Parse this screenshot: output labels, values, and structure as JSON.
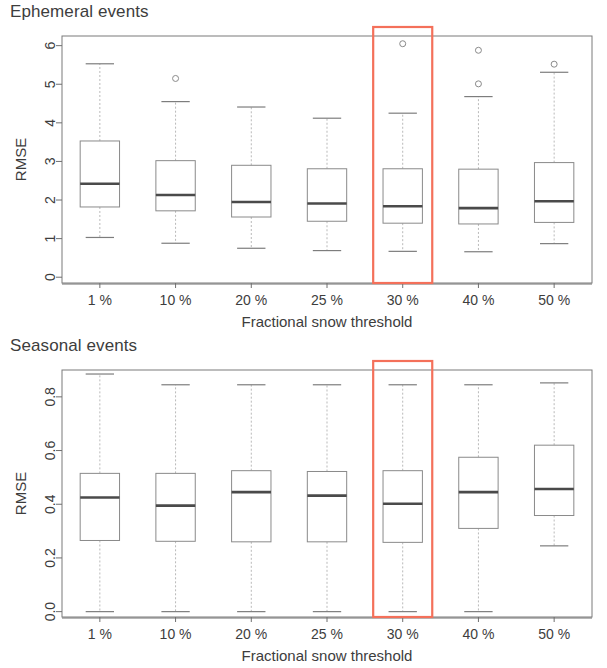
{
  "figure": {
    "width": 607,
    "height": 668,
    "background": "#ffffff",
    "highlight_color": "#f4705a",
    "box_line_color": "#8a8a8a",
    "median_color": "#4a4a4a",
    "whisker_color": "#b9b9b9"
  },
  "chart_data": [
    {
      "type": "box",
      "panel_id": "ephemeral",
      "title": "Ephemeral events",
      "xlabel": "Fractional snow threshold",
      "ylabel": "RMSE",
      "categories": [
        "1 %",
        "10 %",
        "20 %",
        "25 %",
        "30 %",
        "40 %",
        "50 %"
      ],
      "ytick_labels": [
        "0",
        "1",
        "2",
        "3",
        "4",
        "5",
        "6"
      ],
      "ytick_values": [
        0,
        1,
        2,
        3,
        4,
        5,
        6
      ],
      "ylim": [
        -0.15,
        6.25
      ],
      "grid": false,
      "legend": "none",
      "highlighted_category": "30 %",
      "boxes": [
        {
          "category": "1 %",
          "whisker_low": 1.03,
          "q1": 1.82,
          "median": 2.42,
          "q3": 3.53,
          "whisker_high": 5.53,
          "outliers": []
        },
        {
          "category": "10 %",
          "whisker_low": 0.88,
          "q1": 1.72,
          "median": 2.13,
          "q3": 3.02,
          "whisker_high": 4.55,
          "outliers": [
            5.15
          ]
        },
        {
          "category": "20 %",
          "whisker_low": 0.75,
          "q1": 1.56,
          "median": 1.95,
          "q3": 2.9,
          "whisker_high": 4.41,
          "outliers": []
        },
        {
          "category": "25 %",
          "whisker_low": 0.69,
          "q1": 1.45,
          "median": 1.91,
          "q3": 2.81,
          "whisker_high": 4.12,
          "outliers": []
        },
        {
          "category": "30 %",
          "whisker_low": 0.67,
          "q1": 1.4,
          "median": 1.84,
          "q3": 2.81,
          "whisker_high": 4.25,
          "outliers": [
            6.05
          ]
        },
        {
          "category": "40 %",
          "whisker_low": 0.66,
          "q1": 1.38,
          "median": 1.79,
          "q3": 2.8,
          "whisker_high": 4.68,
          "outliers": [
            5.88,
            5.01
          ]
        },
        {
          "category": "50 %",
          "whisker_low": 0.87,
          "q1": 1.42,
          "median": 1.97,
          "q3": 2.97,
          "whisker_high": 5.31,
          "outliers": [
            5.52
          ]
        }
      ]
    },
    {
      "type": "box",
      "panel_id": "seasonal",
      "title": "Seasonal events",
      "xlabel": "Fractional snow threshold",
      "ylabel": "RMSE",
      "categories": [
        "1 %",
        "10 %",
        "20 %",
        "25 %",
        "30 %",
        "40 %",
        "50 %"
      ],
      "ytick_labels": [
        "0.0",
        "0.2",
        "0.4",
        "0.6",
        "0.8"
      ],
      "ytick_values": [
        0.0,
        0.2,
        0.4,
        0.6,
        0.8
      ],
      "ylim": [
        -0.02,
        0.9
      ],
      "grid": false,
      "legend": "none",
      "highlighted_category": "30 %",
      "boxes": [
        {
          "category": "1 %",
          "whisker_low": 0.0,
          "q1": 0.265,
          "median": 0.425,
          "q3": 0.515,
          "whisker_high": 0.885,
          "outliers": []
        },
        {
          "category": "10 %",
          "whisker_low": 0.0,
          "q1": 0.262,
          "median": 0.395,
          "q3": 0.515,
          "whisker_high": 0.845,
          "outliers": []
        },
        {
          "category": "20 %",
          "whisker_low": 0.0,
          "q1": 0.26,
          "median": 0.445,
          "q3": 0.525,
          "whisker_high": 0.845,
          "outliers": []
        },
        {
          "category": "25 %",
          "whisker_low": 0.0,
          "q1": 0.26,
          "median": 0.432,
          "q3": 0.522,
          "whisker_high": 0.845,
          "outliers": []
        },
        {
          "category": "30 %",
          "whisker_low": 0.0,
          "q1": 0.258,
          "median": 0.402,
          "q3": 0.525,
          "whisker_high": 0.845,
          "outliers": []
        },
        {
          "category": "40 %",
          "whisker_low": 0.0,
          "q1": 0.31,
          "median": 0.445,
          "q3": 0.575,
          "whisker_high": 0.845,
          "outliers": []
        },
        {
          "category": "50 %",
          "whisker_low": 0.245,
          "q1": 0.358,
          "median": 0.457,
          "q3": 0.62,
          "whisker_high": 0.852,
          "outliers": []
        }
      ]
    }
  ]
}
